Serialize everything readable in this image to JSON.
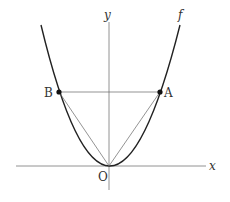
{
  "diagram": {
    "title": "",
    "curve": {
      "name": "f",
      "type": "parabola",
      "equation_form": "y = a x^2"
    },
    "axes": {
      "x_label": "x",
      "y_label": "y",
      "origin_label": "O"
    },
    "points": [
      {
        "label": "A",
        "position": "right branch"
      },
      {
        "label": "B",
        "position": "left branch"
      }
    ],
    "segments": [
      "AB",
      "OA",
      "OB"
    ],
    "colors": {
      "line": "#333333",
      "axis": "#666666",
      "background": "#ffffff"
    }
  }
}
